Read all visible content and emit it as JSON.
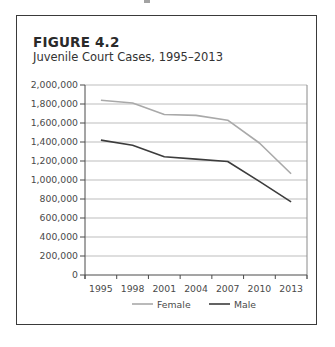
{
  "figure": {
    "label": "FIGURE 4.2",
    "title": "Juvenile Court Cases, 1995–2013"
  },
  "chart_data": {
    "type": "line",
    "title": "Juvenile Court Cases, 1995–2013",
    "figure_label": "FIGURE 4.2",
    "xlabel": "",
    "ylabel": "",
    "categories": [
      "1995",
      "1998",
      "2001",
      "2004",
      "2007",
      "2010",
      "2013"
    ],
    "series": [
      {
        "name": "Female",
        "color": "#a9a9a9",
        "values": [
          1840000,
          1810000,
          1690000,
          1680000,
          1630000,
          1390000,
          1065000
        ]
      },
      {
        "name": "Male",
        "color": "#3c3c3c",
        "values": [
          1420000,
          1365000,
          1245000,
          1220000,
          1195000,
          985000,
          770000
        ]
      }
    ],
    "ylim": [
      0,
      2000000
    ],
    "yticks": [
      0,
      200000,
      400000,
      600000,
      800000,
      1000000,
      1200000,
      1400000,
      1600000,
      1800000,
      2000000
    ],
    "ytick_labels": [
      "0",
      "200,000",
      "400,000",
      "600,000",
      "800,000",
      "1,000,000",
      "1,200,000",
      "1,400,000",
      "1,600,000",
      "1,800,000",
      "2,000,000"
    ],
    "grid": true,
    "legend_position": "bottom",
    "legend": [
      "Female",
      "Male"
    ]
  },
  "colors": {
    "frame": "#3a3a3a",
    "grid": "#bdbdbd",
    "axis": "#4a4a4a"
  }
}
